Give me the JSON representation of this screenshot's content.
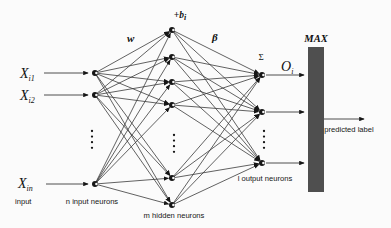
{
  "diagram": {
    "inputs": [
      {
        "symbol": "X",
        "sub": "i1"
      },
      {
        "symbol": "X",
        "sub": "i2"
      },
      {
        "symbol": "X",
        "sub": "in"
      }
    ],
    "labels": {
      "weight": "w",
      "bias_main": "+b",
      "bias_sub": "i",
      "beta": "β",
      "sigma": "Σ",
      "output_main": "O",
      "output_sub": "i",
      "max": "MAX",
      "predicted_label": "predicted label",
      "input_caption": "input",
      "input_layer_caption": "n input neurons",
      "hidden_layer_caption": "m hidden neurons",
      "output_layer_caption": "l output neurons"
    },
    "colors": {
      "max_bar": "#4f4f4f",
      "line": "#3a3a3a",
      "node": "#161616",
      "background": "#fbfbfb"
    }
  }
}
